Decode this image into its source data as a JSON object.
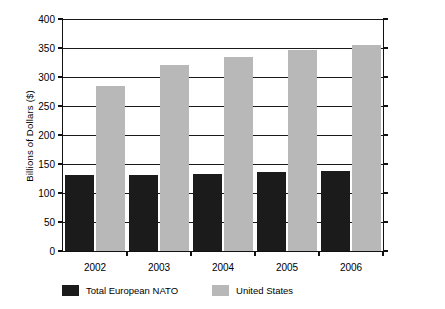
{
  "chart_data": {
    "type": "bar",
    "title": "",
    "xlabel": "",
    "ylabel": "Billions of Dollars ($)",
    "categories": [
      "2002",
      "2003",
      "2004",
      "2005",
      "2006"
    ],
    "series": [
      {
        "name": "Total European NATO",
        "color": "#1b1b1b",
        "values": [
          131,
          131,
          133,
          136,
          138
        ]
      },
      {
        "name": "United States",
        "color": "#b8b8b8",
        "values": [
          284,
          320,
          335,
          346,
          356
        ]
      }
    ],
    "ylim": [
      0,
      400
    ],
    "yticks": [
      0,
      50,
      100,
      150,
      200,
      250,
      300,
      350,
      400
    ],
    "ytick_labels": [
      "0",
      "50",
      "100",
      "150",
      "200",
      "250",
      "300",
      "350",
      "400"
    ],
    "grid": true,
    "legend_position": "bottom"
  },
  "legend": {
    "entries": [
      {
        "label": "Total European NATO"
      },
      {
        "label": "United States"
      }
    ]
  }
}
